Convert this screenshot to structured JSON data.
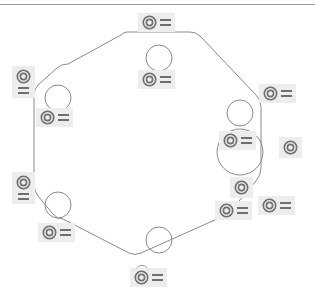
{
  "view": {
    "title": "Sketch Constraint View",
    "background_color": "#ffffff",
    "chip_color": "#ededed",
    "outline_color": "#8a8a8a",
    "icon_color": "#6e6e6e",
    "width": 315,
    "height": 304
  },
  "rule": {
    "name": "top-divider",
    "color": "#9b9b9b"
  },
  "geometry": {
    "outline_name": "hexagonal-plate-outline",
    "outline_path": "M 127 32 L 190 32 Q 196 32 200 36 L 256 95 Q 261 100 261 107 L 261 168 Q 261 175 256 181 L 228 214 Q 224 219 217 219 L 141 253 Q 135 256 129 253 L 63 219 Q 57 219 53 214 L 38 196 Q 34 191 34 184 L 34 96 Q 34 89 38 85 L 57 68 Q 61 64 68 64 L 121 35 Q 124 32 127 32",
    "holes": [
      {
        "name": "hole-top-center",
        "cx": 159,
        "cy": 58,
        "r": 13
      },
      {
        "name": "hole-left-upper",
        "cx": 58,
        "cy": 98,
        "r": 13
      },
      {
        "name": "hole-left-lower",
        "cx": 58,
        "cy": 205,
        "r": 13
      },
      {
        "name": "hole-bottom-center",
        "cx": 159,
        "cy": 240,
        "r": 13
      },
      {
        "name": "hole-right-upper",
        "cx": 240,
        "cy": 113,
        "r": 13
      },
      {
        "name": "hole-right-bore",
        "cx": 240,
        "cy": 152,
        "r": 23
      },
      {
        "name": "hole-right-lower-arc",
        "cx": 240,
        "cy": 189,
        "r": 8
      }
    ]
  },
  "markers": [
    {
      "id": "m1",
      "name": "equal-constraint-top",
      "layout": "horiz",
      "x": 138,
      "y": 13,
      "equals": true,
      "hat": false,
      "equals_label": "="
    },
    {
      "id": "m2",
      "name": "equal-constraint-top-inner",
      "layout": "horiz",
      "x": 138,
      "y": 70,
      "equals": true,
      "hat": false,
      "equals_label": "="
    },
    {
      "id": "m3",
      "name": "equal-constraint-left-outer",
      "layout": "vert",
      "x": 12,
      "y": 66,
      "equals": true,
      "hat": false,
      "equals_label": "="
    },
    {
      "id": "m4",
      "name": "equal-constraint-left-upper",
      "layout": "horiz",
      "x": 36,
      "y": 108,
      "equals": true,
      "hat": false,
      "equals_label": "="
    },
    {
      "id": "m5",
      "name": "equal-constraint-left-mid",
      "layout": "vert",
      "x": 12,
      "y": 172,
      "equals": true,
      "hat": false,
      "equals_label": "="
    },
    {
      "id": "m6",
      "name": "equal-constraint-left-lower",
      "layout": "horiz",
      "x": 38,
      "y": 223,
      "equals": true,
      "hat": false,
      "equals_label": "="
    },
    {
      "id": "m7",
      "name": "equal-constraint-bottom",
      "layout": "horiz",
      "x": 130,
      "y": 268,
      "equals": true,
      "hat": true,
      "equals_label": "="
    },
    {
      "id": "m8",
      "name": "equal-constraint-right-upper",
      "layout": "horiz",
      "x": 259,
      "y": 84,
      "equals": true,
      "hat": false,
      "equals_label": "="
    },
    {
      "id": "m9",
      "name": "equal-constraint-bore-center",
      "layout": "horiz",
      "x": 219,
      "y": 131,
      "equals": true,
      "hat": false,
      "equals_label": "="
    },
    {
      "id": "m10",
      "name": "equal-constraint-right-outer",
      "layout": "solo",
      "x": 279,
      "y": 137,
      "equals": false,
      "hat": false,
      "equals_label": ""
    },
    {
      "id": "m11",
      "name": "equal-constraint-right-arc",
      "layout": "solo",
      "x": 230,
      "y": 177,
      "equals": false,
      "hat": false,
      "equals_label": ""
    },
    {
      "id": "m12",
      "name": "equal-constraint-right-lower",
      "layout": "horiz",
      "x": 258,
      "y": 196,
      "equals": true,
      "hat": false,
      "equals_label": "="
    },
    {
      "id": "m13",
      "name": "equal-constraint-bottom-right",
      "layout": "horiz",
      "x": 215,
      "y": 201,
      "equals": true,
      "hat": false,
      "equals_label": "="
    }
  ]
}
